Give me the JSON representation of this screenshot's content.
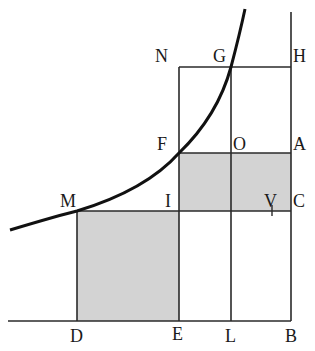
{
  "figure": {
    "colors": {
      "line": "#2a2a2a",
      "curve": "#111111",
      "shade": "#d3d3d3",
      "background": "#ffffff"
    },
    "points": {
      "N": "N",
      "G": "G",
      "H": "H",
      "F": "F",
      "O": "O",
      "A": "A",
      "M": "M",
      "I": "I",
      "V": "V",
      "C": "C",
      "D": "D",
      "E": "E",
      "L": "L",
      "B": "B"
    },
    "shaded_regions": [
      "MDEI",
      "FICA"
    ],
    "rectangles": [
      "NGLE",
      "GHBL",
      "FICA",
      "MDEI"
    ]
  }
}
